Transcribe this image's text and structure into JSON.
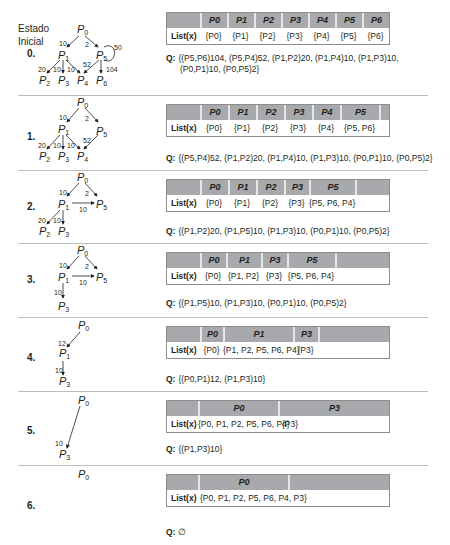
{
  "initial_label": [
    "Estado",
    "Inicial"
  ],
  "list_label": "List(x)",
  "q_label": "Q:",
  "steps": [
    {
      "label": "0.",
      "headers": [
        "",
        "P0",
        "P1",
        "P2",
        "P3",
        "P4",
        "P5",
        "P6"
      ],
      "lists": [
        "{P0}",
        "{P1}",
        "{P2}",
        "{P3}",
        "{P4}",
        "{P5}",
        "{P6}"
      ],
      "q_lines": [
        "{(P5,P6)104, (P5,P4)52, (P1,P2)20, (P1,P4)10, (P1,P3)10,",
        "(P0,P1)10, (P0,P5)2}"
      ]
    },
    {
      "label": "1.",
      "headers": [
        "",
        "P0",
        "P1",
        "P2",
        "P3",
        "P4",
        "P5",
        ""
      ],
      "lists": [
        "{P0}",
        "{P1}",
        "{P2}",
        "{P3}",
        "{P4}",
        "{P5, P6}"
      ],
      "q_lines": [
        "{(P5,P4)52, (P1,P2)20, (P1,P4)10, (P1,P3)10, (P0,P1)10, (P0,P5)2}"
      ]
    },
    {
      "label": "2.",
      "headers": [
        "",
        "P0",
        "P1",
        "P2",
        "P3",
        "P5",
        ""
      ],
      "lists": [
        "{P0}",
        "{P1}",
        "{P2}",
        "{P3}",
        "{P5, P6, P4}"
      ],
      "q_lines": [
        "{(P1,P2)20, (P1,P5)10, (P1,P3)10, (P0,P1)10, (P0,P5)2}"
      ]
    },
    {
      "label": "3.",
      "headers": [
        "",
        "P0",
        "P1",
        "P3",
        "P5",
        ""
      ],
      "lists": [
        "{P0}",
        "{P1, P2}",
        "{P3}",
        "{P5, P6, P4}"
      ],
      "q_lines": [
        "{(P1,P5)10, (P1,P3)10, (P0,P1)10, (P0,P5)2}"
      ]
    },
    {
      "label": "4.",
      "headers": [
        "",
        "P0",
        "P1",
        "P3",
        ""
      ],
      "lists": [
        "{P0}",
        "{P1, P2, P5, P6, P4}",
        "{P3}"
      ],
      "q_lines": [
        "{(P0,P1)12, (P1,P3)10}"
      ]
    },
    {
      "label": "5.",
      "headers": [
        "",
        "P0",
        "P3"
      ],
      "lists": [
        "{P0, P1, P2, P5, P6, P4}",
        "{P3}"
      ],
      "q_lines": [
        "{(P1,P3)10}"
      ]
    },
    {
      "label": "6.",
      "headers": [
        "",
        "P0",
        ""
      ],
      "lists": [
        "{P0, P1, P2, P5, P6, P4, P3}"
      ],
      "q_lines": [
        "∅"
      ]
    }
  ],
  "graphs": {
    "g0": {
      "edges": [
        [
          "P0",
          "P1",
          10
        ],
        [
          "P0",
          "P5",
          2
        ],
        [
          "P5",
          "P5",
          50
        ],
        [
          "P1",
          "P2",
          20
        ],
        [
          "P1",
          "P3",
          10
        ],
        [
          "P1",
          "P4",
          10
        ],
        [
          "P5",
          "P4",
          52
        ],
        [
          "P5",
          "P6",
          104
        ]
      ]
    },
    "g1": {
      "edges": [
        [
          "P0",
          "P1",
          10
        ],
        [
          "P0",
          "P5",
          2
        ],
        [
          "P1",
          "P2",
          20
        ],
        [
          "P1",
          "P3",
          10
        ],
        [
          "P1",
          "P4",
          10
        ],
        [
          "P5",
          "P4",
          52
        ]
      ]
    },
    "g2": {
      "edges": [
        [
          "P0",
          "P1",
          10
        ],
        [
          "P0",
          "P5",
          2
        ],
        [
          "P1",
          "P5",
          10
        ],
        [
          "P1",
          "P2",
          20
        ],
        [
          "P1",
          "P3",
          10
        ]
      ]
    },
    "g3": {
      "edges": [
        [
          "P0",
          "P1",
          10
        ],
        [
          "P0",
          "P5",
          2
        ],
        [
          "P1",
          "P5",
          10
        ],
        [
          "P1",
          "P3",
          10
        ]
      ]
    },
    "g4": {
      "edges": [
        [
          "P0",
          "P1",
          12
        ],
        [
          "P1",
          "P3",
          10
        ]
      ]
    },
    "g5": {
      "edges": [
        [
          "P0",
          "P3",
          10
        ]
      ]
    },
    "g6": {
      "edges": []
    }
  }
}
